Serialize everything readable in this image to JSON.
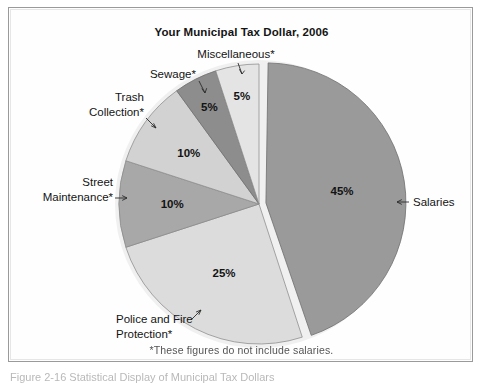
{
  "figure": {
    "title": "Your Municipal Tax Dollar, 2006",
    "footnote": "*These figures do not include salaries.",
    "caption_fragment": "Figure 2-16   Statistical Display of Municipal Tax Dollars",
    "frame_color": "#9a9a9a",
    "background": "#fefefe"
  },
  "chart_data": {
    "type": "pie",
    "title": "Your Municipal Tax Dollar, 2006",
    "xlabel": "",
    "ylabel": "",
    "grid": false,
    "legend_position": "none",
    "label_style": "callouts-with-leader-arrows",
    "units": "percent",
    "total": 100,
    "start_angle_deg": 0,
    "direction": "clockwise",
    "exploded_slice": "Salaries",
    "annotation": "*These figures do not include salaries.",
    "categories": [
      "Salaries",
      "Police and Fire Protection*",
      "Street Maintenance*",
      "Trash Collection*",
      "Sewage*",
      "Miscellaneous*"
    ],
    "values": [
      45,
      25,
      10,
      10,
      5,
      5
    ],
    "value_labels": [
      "45%",
      "25%",
      "10%",
      "10%",
      "5%",
      "5%"
    ],
    "colors": [
      "#9a9a9a",
      "#dcdcdc",
      "#a8a8a8",
      "#d2d2d2",
      "#8d8d8d",
      "#e4e4e4"
    ],
    "slices": [
      {
        "label": "Salaries",
        "value": 45,
        "value_label": "45%",
        "color": "#9a9a9a",
        "exploded": true,
        "callout_side": "right",
        "callout_line1": "Salaries",
        "callout_line2": ""
      },
      {
        "label": "Police and Fire Protection*",
        "value": 25,
        "value_label": "25%",
        "color": "#dcdcdc",
        "exploded": false,
        "callout_side": "bottom-left",
        "callout_line1": "Police and Fire",
        "callout_line2": "Protection*"
      },
      {
        "label": "Street Maintenance*",
        "value": 10,
        "value_label": "10%",
        "color": "#a8a8a8",
        "exploded": false,
        "callout_side": "left",
        "callout_line1": "Street",
        "callout_line2": "Maintenance*"
      },
      {
        "label": "Trash Collection*",
        "value": 10,
        "value_label": "10%",
        "color": "#d2d2d2",
        "exploded": false,
        "callout_side": "upper-left",
        "callout_line1": "Trash",
        "callout_line2": "Collection*"
      },
      {
        "label": "Sewage*",
        "value": 5,
        "value_label": "5%",
        "color": "#8d8d8d",
        "exploded": false,
        "callout_side": "top-left",
        "callout_line1": "Sewage*",
        "callout_line2": ""
      },
      {
        "label": "Miscellaneous*",
        "value": 5,
        "value_label": "5%",
        "color": "#e4e4e4",
        "exploded": false,
        "callout_side": "top",
        "callout_line1": "Miscellaneous*",
        "callout_line2": ""
      }
    ]
  }
}
